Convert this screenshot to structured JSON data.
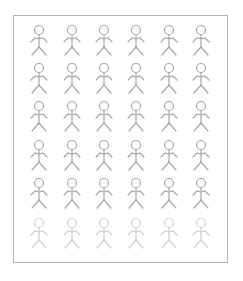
{
  "diagram": {
    "type": "pictogram",
    "icon": "stick-figure-icon",
    "rows": 6,
    "columns": 6,
    "total_figures": 36,
    "figure_color": "#a8a8a8",
    "highlight_row_color": "#d0d0d0",
    "faded_row_index": 5,
    "frame_color": "#b4b4b4",
    "column_centers": [
      39,
      72,
      104,
      136,
      169,
      201
    ],
    "row_tops": [
      25,
      63,
      101,
      140,
      178,
      218
    ]
  }
}
